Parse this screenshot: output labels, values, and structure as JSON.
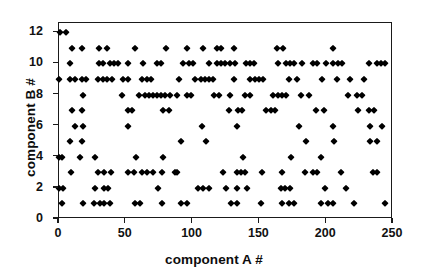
{
  "chart_data": {
    "type": "scatter",
    "title": "",
    "xlabel": "component A #",
    "ylabel": "component B #",
    "xlim": [
      0,
      250
    ],
    "ylim": [
      0,
      12.6
    ],
    "xticks": [
      0,
      50,
      100,
      150,
      200,
      250
    ],
    "yticks": [
      0,
      2,
      4,
      6,
      8,
      10,
      12
    ],
    "grid": false,
    "legend": null,
    "marker": "diamond",
    "marker_color": "#000000",
    "note": "Integer-valued scatter: component B # takes integer levels 1-12 across component A # from 0 to ~245",
    "points": [
      [
        1,
        12
      ],
      [
        5,
        12
      ],
      [
        10,
        11
      ],
      [
        17,
        11
      ],
      [
        30,
        11
      ],
      [
        36,
        11
      ],
      [
        57,
        11
      ],
      [
        80,
        11
      ],
      [
        96,
        11
      ],
      [
        108,
        11
      ],
      [
        118,
        11
      ],
      [
        121,
        11
      ],
      [
        131,
        11
      ],
      [
        163,
        11
      ],
      [
        168,
        11
      ],
      [
        205,
        11
      ],
      [
        8,
        10
      ],
      [
        30,
        10
      ],
      [
        33,
        10
      ],
      [
        38,
        10
      ],
      [
        41,
        10
      ],
      [
        44,
        10
      ],
      [
        52,
        10
      ],
      [
        63,
        10
      ],
      [
        73,
        10
      ],
      [
        76,
        10
      ],
      [
        93,
        10
      ],
      [
        97,
        10
      ],
      [
        100,
        10
      ],
      [
        112,
        10
      ],
      [
        118,
        10
      ],
      [
        121,
        10
      ],
      [
        124,
        10
      ],
      [
        128,
        10
      ],
      [
        132,
        10
      ],
      [
        140,
        10
      ],
      [
        143,
        10
      ],
      [
        146,
        10
      ],
      [
        164,
        10
      ],
      [
        170,
        10
      ],
      [
        173,
        10
      ],
      [
        176,
        10
      ],
      [
        182,
        10
      ],
      [
        190,
        10
      ],
      [
        193,
        10
      ],
      [
        200,
        10
      ],
      [
        205,
        10
      ],
      [
        209,
        10
      ],
      [
        212,
        10
      ],
      [
        232,
        10
      ],
      [
        238,
        10
      ],
      [
        241,
        10
      ],
      [
        244,
        10
      ],
      [
        0,
        9
      ],
      [
        8,
        9
      ],
      [
        12,
        9
      ],
      [
        17,
        9
      ],
      [
        20,
        9
      ],
      [
        29,
        9
      ],
      [
        33,
        9
      ],
      [
        36,
        9
      ],
      [
        40,
        9
      ],
      [
        48,
        9
      ],
      [
        52,
        9
      ],
      [
        62,
        9
      ],
      [
        66,
        9
      ],
      [
        69,
        9
      ],
      [
        90,
        9
      ],
      [
        102,
        9
      ],
      [
        106,
        9
      ],
      [
        109,
        9
      ],
      [
        112,
        9
      ],
      [
        115,
        9
      ],
      [
        131,
        9
      ],
      [
        143,
        9
      ],
      [
        147,
        9
      ],
      [
        150,
        9
      ],
      [
        153,
        9
      ],
      [
        172,
        9
      ],
      [
        178,
        9
      ],
      [
        197,
        9
      ],
      [
        208,
        9
      ],
      [
        218,
        9
      ],
      [
        228,
        9
      ],
      [
        18,
        8
      ],
      [
        47,
        8
      ],
      [
        60,
        8
      ],
      [
        64,
        8
      ],
      [
        67,
        8
      ],
      [
        70,
        8
      ],
      [
        73,
        8
      ],
      [
        76,
        8
      ],
      [
        79,
        8
      ],
      [
        83,
        8
      ],
      [
        88,
        8
      ],
      [
        96,
        8
      ],
      [
        99,
        8
      ],
      [
        116,
        8
      ],
      [
        120,
        8
      ],
      [
        128,
        8
      ],
      [
        139,
        8
      ],
      [
        143,
        8
      ],
      [
        160,
        8
      ],
      [
        164,
        8
      ],
      [
        167,
        8
      ],
      [
        170,
        8
      ],
      [
        181,
        8
      ],
      [
        187,
        8
      ],
      [
        216,
        8
      ],
      [
        223,
        8
      ],
      [
        227,
        8
      ],
      [
        10,
        7
      ],
      [
        17,
        7
      ],
      [
        52,
        7
      ],
      [
        55,
        7
      ],
      [
        78,
        7
      ],
      [
        82,
        7
      ],
      [
        127,
        7
      ],
      [
        134,
        7
      ],
      [
        137,
        7
      ],
      [
        155,
        7
      ],
      [
        159,
        7
      ],
      [
        162,
        7
      ],
      [
        192,
        7
      ],
      [
        198,
        7
      ],
      [
        224,
        7
      ],
      [
        232,
        7
      ],
      [
        236,
        7
      ],
      [
        12,
        6
      ],
      [
        18,
        6
      ],
      [
        52,
        6
      ],
      [
        107,
        6
      ],
      [
        133,
        6
      ],
      [
        180,
        6
      ],
      [
        205,
        6
      ],
      [
        233,
        6
      ],
      [
        242,
        6
      ],
      [
        8,
        5
      ],
      [
        17,
        5
      ],
      [
        91,
        5
      ],
      [
        110,
        5
      ],
      [
        185,
        5
      ],
      [
        206,
        5
      ],
      [
        233,
        5
      ],
      [
        238,
        5
      ],
      [
        0,
        4
      ],
      [
        2,
        4
      ],
      [
        16,
        4
      ],
      [
        27,
        4
      ],
      [
        58,
        4
      ],
      [
        78,
        4
      ],
      [
        138,
        4
      ],
      [
        174,
        4
      ],
      [
        196,
        4
      ],
      [
        9,
        3
      ],
      [
        29,
        3
      ],
      [
        34,
        3
      ],
      [
        39,
        3
      ],
      [
        52,
        3
      ],
      [
        56,
        3
      ],
      [
        62,
        3
      ],
      [
        66,
        3
      ],
      [
        70,
        3
      ],
      [
        77,
        3
      ],
      [
        87,
        3
      ],
      [
        88,
        3
      ],
      [
        123,
        3
      ],
      [
        133,
        3
      ],
      [
        136,
        3
      ],
      [
        139,
        3
      ],
      [
        152,
        3
      ],
      [
        167,
        3
      ],
      [
        184,
        3
      ],
      [
        190,
        3
      ],
      [
        193,
        3
      ],
      [
        211,
        3
      ],
      [
        235,
        3
      ],
      [
        238,
        3
      ],
      [
        0,
        2
      ],
      [
        3,
        2
      ],
      [
        27,
        2
      ],
      [
        34,
        2
      ],
      [
        37,
        2
      ],
      [
        74,
        2
      ],
      [
        104,
        2
      ],
      [
        108,
        2
      ],
      [
        112,
        2
      ],
      [
        125,
        2
      ],
      [
        133,
        2
      ],
      [
        141,
        2
      ],
      [
        166,
        2
      ],
      [
        169,
        2
      ],
      [
        173,
        2
      ],
      [
        199,
        2
      ],
      [
        215,
        2
      ],
      [
        2,
        1
      ],
      [
        18,
        1
      ],
      [
        26,
        1
      ],
      [
        31,
        1
      ],
      [
        34,
        1
      ],
      [
        38,
        1
      ],
      [
        57,
        1
      ],
      [
        61,
        1
      ],
      [
        77,
        1
      ],
      [
        91,
        1
      ],
      [
        96,
        1
      ],
      [
        129,
        1
      ],
      [
        133,
        1
      ],
      [
        151,
        1
      ],
      [
        167,
        1
      ],
      [
        172,
        1
      ],
      [
        176,
        1
      ],
      [
        196,
        1
      ],
      [
        201,
        1
      ],
      [
        205,
        1
      ],
      [
        221,
        1
      ],
      [
        244,
        1
      ]
    ]
  }
}
